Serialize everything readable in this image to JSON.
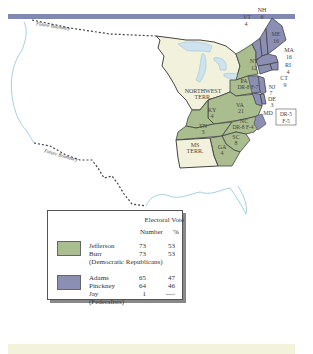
{
  "map": {
    "title": "Election of 1800",
    "boundary_labels": [
      "Future Boundary",
      "Future Boundary"
    ],
    "territories": [
      {
        "name": "NORTHWEST TERR.",
        "line1": "NORTHWEST",
        "line2": "TERR."
      },
      {
        "name": "MS TERR.",
        "line1": "MS",
        "line2": "TERR."
      }
    ],
    "states": [
      {
        "abbr": "NH",
        "votes": "6",
        "party": "Federalist"
      },
      {
        "abbr": "VT",
        "votes": "4",
        "party": "Federalist"
      },
      {
        "abbr": "ME",
        "votes": "16",
        "party": "Federalist",
        "note": "ME label on MA district"
      },
      {
        "abbr": "MA",
        "votes": "16",
        "party": "Federalist"
      },
      {
        "abbr": "RI",
        "votes": "4",
        "party": "Federalist"
      },
      {
        "abbr": "CT",
        "votes": "9",
        "party": "Federalist"
      },
      {
        "abbr": "NY",
        "votes": "12",
        "party": "Democratic Republican"
      },
      {
        "abbr": "PA",
        "votes": "DR-8 F-7",
        "party": "Split"
      },
      {
        "abbr": "NJ",
        "votes": "7",
        "party": "Federalist"
      },
      {
        "abbr": "DE",
        "votes": "3",
        "party": "Federalist"
      },
      {
        "abbr": "MD",
        "votes": "DR-5 F-5",
        "party": "Split"
      },
      {
        "abbr": "VA",
        "votes": "21",
        "party": "Democratic Republican"
      },
      {
        "abbr": "KY",
        "votes": "4",
        "party": "Democratic Republican"
      },
      {
        "abbr": "TN",
        "votes": "3",
        "party": "Democratic Republican"
      },
      {
        "abbr": "NC",
        "votes": "DR-8 F-4",
        "party": "Split"
      },
      {
        "abbr": "SC",
        "votes": "8",
        "party": "Democratic Republican"
      },
      {
        "abbr": "GA",
        "votes": "4",
        "party": "Democratic Republican"
      }
    ],
    "md_box": {
      "line1": "DR-5",
      "line2": "F-5"
    },
    "pa_label": "DR-8 F-7",
    "nc_label": "DR-8 F-4"
  },
  "legend": {
    "header": "Electoral Vote",
    "col_number": "Number",
    "col_percent": "%",
    "groups": [
      {
        "party": "(Democratic Republicans)",
        "color": "#a9bd8f",
        "candidates": [
          {
            "name": "Jefferson",
            "number": "73",
            "percent": "53"
          },
          {
            "name": "Burr",
            "number": "73",
            "percent": "53"
          }
        ]
      },
      {
        "party": "(Federalists)",
        "color": "#8a8fb3",
        "candidates": [
          {
            "name": "Adams",
            "number": "65",
            "percent": "47"
          },
          {
            "name": "Pinckney",
            "number": "64",
            "percent": "46"
          },
          {
            "name": "Jay",
            "number": "1",
            "percent": "----"
          }
        ]
      }
    ]
  },
  "colors": {
    "democratic_republican": "#a9bd8f",
    "federalist": "#8a8fb3",
    "territory": "#f1f1dc",
    "water": "#cfe3ee",
    "top_bar": "#8088b4",
    "bottom_band": "#f3f3dc"
  }
}
